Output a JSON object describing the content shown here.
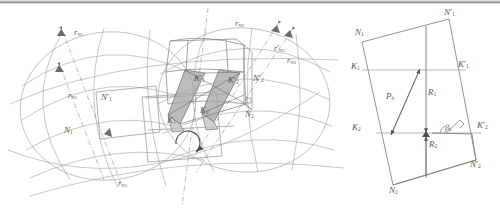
{
  "figure": {
    "panels": [
      "left-3d-sphere-construction",
      "right-planar-base-plane"
    ]
  },
  "colors": {
    "ink": "#6b6b6b",
    "ink_light": "#9a9a9a",
    "ink_dark": "#4a4a4a",
    "shade_fill": "#a8a8a8",
    "shade_fill_light": "#c2c2c2",
    "paper": "#ffffff",
    "scan_edge": "#8c8c8c"
  },
  "left": {
    "labels": [
      {
        "id": "r-N1-top",
        "base": "r",
        "sub": "N1",
        "prime": false,
        "x": 74,
        "y": 29
      },
      {
        "id": "r-N1-mid",
        "base": "r",
        "sub": "N1",
        "prime": false,
        "x": 68,
        "y": 92
      },
      {
        "id": "r-N1-bottom",
        "base": "r",
        "sub": "N1",
        "prime": false,
        "x": 118,
        "y": 180
      },
      {
        "id": "N1-prime",
        "base": "N",
        "sub": "1",
        "prime": true,
        "x": 101,
        "y": 93
      },
      {
        "id": "N1",
        "base": "N",
        "sub": "1",
        "prime": false,
        "x": 64,
        "y": 126
      },
      {
        "id": "r-N2-top",
        "base": "r",
        "sub": "N2",
        "prime": false,
        "x": 235,
        "y": 20
      },
      {
        "id": "r-N2-prime",
        "base": "r",
        "sub": "N2",
        "prime": true,
        "x": 274,
        "y": 45
      },
      {
        "id": "r-N2-right",
        "base": "r",
        "sub": "N2",
        "prime": false,
        "x": 287,
        "y": 57
      },
      {
        "id": "N2-prime",
        "base": "N",
        "sub": "2",
        "prime": true,
        "x": 253,
        "y": 74
      },
      {
        "id": "N2",
        "base": "N",
        "sub": "2",
        "prime": false,
        "x": 245,
        "y": 110
      },
      {
        "id": "K1-prime",
        "base": "K",
        "sub": "1",
        "prime": true,
        "x": 194,
        "y": 74
      },
      {
        "id": "K2-prime",
        "base": "K",
        "sub": "2",
        "prime": true,
        "x": 228,
        "y": 76
      },
      {
        "id": "K1",
        "base": "K",
        "sub": "1",
        "prime": false,
        "x": 167,
        "y": 116
      },
      {
        "id": "K2",
        "base": "K",
        "sub": "2",
        "prime": false,
        "x": 200,
        "y": 106
      }
    ],
    "annotations": {
      "rotation_arrow": "rotation-direction-arc"
    }
  },
  "right": {
    "labels": [
      {
        "id": "N1",
        "base": "N",
        "sub": "1",
        "prime": false,
        "x": 355,
        "y": 34
      },
      {
        "id": "N1-prime",
        "base": "N",
        "sub": "1",
        "prime": true,
        "x": 444,
        "y": 15
      },
      {
        "id": "K1",
        "base": "K",
        "sub": "1",
        "prime": false,
        "x": 353,
        "y": 69
      },
      {
        "id": "K1-prime",
        "base": "K",
        "sub": "1",
        "prime": true,
        "x": 458,
        "y": 67
      },
      {
        "id": "K2",
        "base": "K",
        "sub": "2",
        "prime": false,
        "x": 353,
        "y": 129
      },
      {
        "id": "K2-prime",
        "base": "K",
        "sub": "2",
        "prime": true,
        "x": 477,
        "y": 127
      },
      {
        "id": "N2",
        "base": "N",
        "sub": "2",
        "prime": false,
        "x": 392,
        "y": 183
      },
      {
        "id": "N2-prime",
        "base": "N",
        "sub": "2",
        "prime": true,
        "x": 470,
        "y": 157
      },
      {
        "id": "P-b",
        "base": "P",
        "sub": "b",
        "prime": false,
        "x": 388,
        "y": 98
      },
      {
        "id": "R-1",
        "base": "R",
        "sub": "1",
        "prime": false,
        "x": 424,
        "y": 94
      },
      {
        "id": "R-2",
        "base": "R",
        "sub": "2",
        "prime": false,
        "x": 427,
        "y": 140
      },
      {
        "id": "beta-b",
        "base": "β",
        "sub": "b",
        "prime": false,
        "x": 439,
        "y": 134
      }
    ],
    "annotations": {
      "right_angle_marker": "perpendicular-mark",
      "dimension_arrows": [
        "P-b-double-arrow",
        "R-1-arrow-down",
        "R-2-arrow-up"
      ]
    }
  }
}
